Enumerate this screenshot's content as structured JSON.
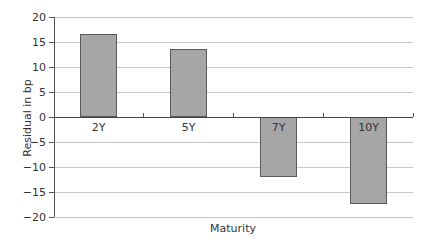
{
  "chart_data": {
    "type": "bar",
    "title": "",
    "xlabel": "Maturity",
    "ylabel": "Residual in bp",
    "categories": [
      "2Y",
      "5Y",
      "7Y",
      "10Y"
    ],
    "values": [
      16.6,
      13.6,
      -12.0,
      -17.3
    ],
    "ylim": [
      -20,
      20
    ],
    "yticks": [
      20,
      15,
      10,
      5,
      0,
      -5,
      -10,
      -15,
      -20
    ],
    "ytick_labels": [
      "20",
      "15",
      "10",
      "5",
      "0",
      "−5",
      "−10",
      "−15",
      "−20"
    ],
    "grid": true,
    "legend": null,
    "colors": {
      "bar_fill": "#a6a6a6",
      "bar_border": "#5a5a5a",
      "grid": "#c8c8c8"
    }
  }
}
